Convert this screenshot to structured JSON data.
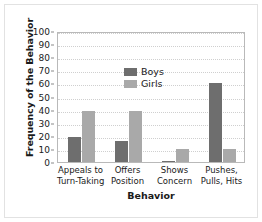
{
  "chart_data": {
    "type": "bar",
    "title": "",
    "xlabel": "Behavior",
    "ylabel": "Frequency of the Behavior",
    "categories": [
      "Appeals to\nTurn-Taking",
      "Offers\nPosition",
      "Shows\nConcern",
      "Pushes,\nPulls, Hits"
    ],
    "category_lines": [
      [
        "Appeals to",
        "Turn-Taking"
      ],
      [
        "Offers",
        "Position"
      ],
      [
        "Shows",
        "Concern"
      ],
      [
        "Pushes,",
        "Pulls, Hits"
      ]
    ],
    "series": [
      {
        "name": "Boys",
        "color": "#6e6e6e",
        "values": [
          19,
          16,
          1,
          60
        ]
      },
      {
        "name": "Girls",
        "color": "#a9a9a9",
        "values": [
          39,
          39,
          10,
          10
        ]
      }
    ],
    "ylim": [
      0,
      100
    ],
    "ytick_values": [
      0,
      10,
      20,
      30,
      40,
      50,
      60,
      70,
      80,
      90,
      100
    ],
    "ytick_labels": [
      "0",
      "10",
      "20",
      "30",
      "40",
      "50",
      "60",
      "70",
      "80",
      "90",
      "100"
    ],
    "grid": "horizontal-dotted",
    "legend_position": "top-left-inside"
  },
  "legend": {
    "items": [
      {
        "label": "Boys",
        "swatch_name": "legend-swatch-boys"
      },
      {
        "label": "Girls",
        "swatch_name": "legend-swatch-girls"
      }
    ]
  },
  "axes": {
    "y_title": "Frequency of the Behavior",
    "x_title": "Behavior"
  }
}
